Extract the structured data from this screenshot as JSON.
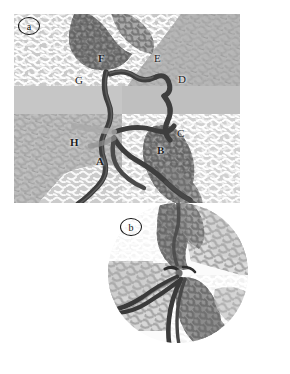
{
  "figure": {
    "background_color": "#ffffff",
    "width": 290,
    "height": 374
  },
  "panels": [
    {
      "id": "a",
      "tag": "a",
      "shape": "rectangle",
      "bounds": {
        "x": 14,
        "y": 14,
        "width": 226,
        "height": 189
      },
      "description": "Rectangular field showing four differently-shaded fibrous textures separated by a mid-grey horizontal band, traversed by dark fibre strands with labelled junction points.",
      "regions": [
        {
          "name": "top-left-light-mesh",
          "fill": "#c9c9c9",
          "texture": "light-squiggle",
          "texture_color": "#ffffff"
        },
        {
          "name": "top-right-light-mesh",
          "fill": "#c7c7c7",
          "texture": "light-squiggle",
          "texture_color": "#fbfbfb"
        },
        {
          "name": "top-right-dark-mesh",
          "fill": "#b4b4b4",
          "texture": "mid-squiggle",
          "texture_color": "#9c9c9c"
        },
        {
          "name": "centre-grey-band",
          "fill": "#c6c6c6",
          "texture": "none",
          "texture_color": "#c6c6c6"
        },
        {
          "name": "bottom-left-mid-mesh",
          "fill": "#c2c2c2",
          "texture": "mid-squiggle",
          "texture_color": "#adadad"
        },
        {
          "name": "bottom-right-light-mesh",
          "fill": "#cfcfcf",
          "texture": "light-squiggle",
          "texture_color": "#fdfdfd"
        },
        {
          "name": "upper-dark-fibre-mass",
          "fill": "#8e8e8e",
          "texture": "dark-fibrils",
          "texture_color": "#6b6b6b"
        },
        {
          "name": "lower-dark-fibre-mass",
          "fill": "#9a9a9a",
          "texture": "dark-fibrils",
          "texture_color": "#757575"
        }
      ],
      "labels": [
        {
          "text": "F",
          "x": 98,
          "y": 45,
          "points_to": "upper-dark-fibre-mass-junction"
        },
        {
          "text": "G",
          "x": 75,
          "y": 67,
          "points_to": "left-vertical-fibre-top-junction"
        },
        {
          "text": "E",
          "x": 154,
          "y": 45,
          "points_to": "upper-right-loop"
        },
        {
          "text": "D",
          "x": 178,
          "y": 66,
          "points_to": "right-descending-fibre"
        },
        {
          "text": "C",
          "x": 177,
          "y": 120,
          "points_to": "right-lower-junction"
        },
        {
          "text": "B",
          "x": 157,
          "y": 137,
          "points_to": "lower-dark-fibre-mass"
        },
        {
          "text": "H",
          "x": 70,
          "y": 129,
          "points_to": "left-fibre-shadow-branch"
        },
        {
          "text": "A",
          "x": 96,
          "y": 148,
          "points_to": "lower-left-fibre-loop"
        }
      ],
      "fibre_color": "#3e3e3e",
      "fibre_highlight": "#5f5f5f"
    },
    {
      "id": "b",
      "tag": "b",
      "shape": "circle",
      "bounds": {
        "x": 95,
        "y": 203,
        "width": 167,
        "height": 140
      },
      "description": "Circular magnified inset of the central junction in panel a, showing four quadrants of fibrous mesh and three dark fibre strands converging at a node.",
      "regions": [
        {
          "name": "inset-top-left-light-mesh",
          "fill": "#f3f3f3",
          "texture": "light-squiggle",
          "texture_color": "#ffffff"
        },
        {
          "name": "inset-top-right-mid-mesh",
          "fill": "#dcdcdc",
          "texture": "mid-squiggle",
          "texture_color": "#a9a9a9"
        },
        {
          "name": "inset-bottom-left-mid-mesh",
          "fill": "#d6d6d6",
          "texture": "mid-squiggle",
          "texture_color": "#b0b0b0"
        },
        {
          "name": "inset-bottom-right-light-mesh",
          "fill": "#f0f0f0",
          "texture": "light-squiggle",
          "texture_color": "#ffffff"
        },
        {
          "name": "inset-vertical-dark-fibril-band",
          "fill": "#8d8d8d",
          "texture": "dark-fibrils",
          "texture_color": "#6e6e6e"
        }
      ],
      "labels": [],
      "fibre_color": "#3a3a3a",
      "fibre_highlight": "#606060"
    }
  ],
  "colors": {
    "page_background": "#ffffff",
    "mid_grey": "#c6c6c6",
    "light_mesh": "#ffffff",
    "mid_mesh": "#a8a8a8",
    "dark_fibril": "#6b6b6b",
    "fibre_dark": "#3e3e3e",
    "label_text": "#1c1c1c",
    "tag_outline": "#111111"
  }
}
